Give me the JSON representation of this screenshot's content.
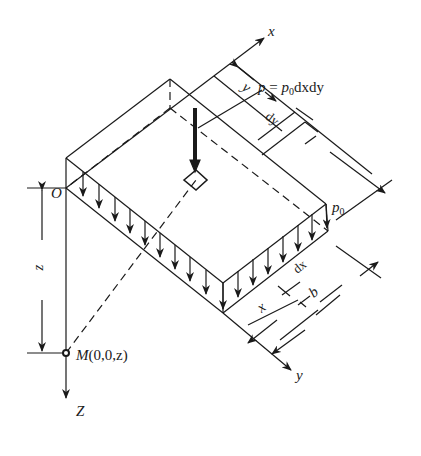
{
  "diagram": {
    "type": "rectangular-uniform-load-stress-diagram",
    "stroke_color": "#1a1a1a",
    "labels": {
      "x_axis": "x",
      "y_axis": "y",
      "z_axis": "Z",
      "origin": "O",
      "point_M": "M",
      "point_M_coords": "(0,0,z)",
      "depth": "z",
      "dim_y": "y",
      "dim_dy": "dy",
      "dim_x": "x",
      "dim_dx": "dx",
      "dim_b": "b",
      "load_symbol": "p",
      "load_sub": "0",
      "formula_lhs": "p",
      "formula_eq": " = ",
      "formula_p": "p",
      "formula_sub": "0",
      "formula_rest": "dxdy"
    }
  }
}
